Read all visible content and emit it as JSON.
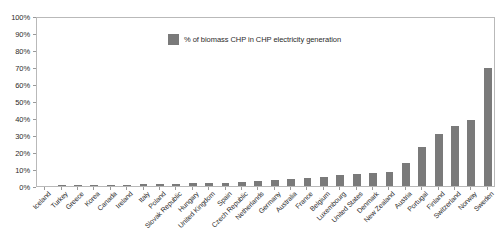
{
  "chart_data": {
    "type": "bar",
    "title": "",
    "xlabel": "",
    "ylabel": "",
    "ylim": [
      0,
      100
    ],
    "ytick_labels": [
      "100%",
      "90%",
      "80%",
      "70%",
      "60%",
      "50%",
      "40%",
      "30%",
      "20%",
      "10%",
      "0%"
    ],
    "ytick_values": [
      100,
      90,
      80,
      70,
      60,
      50,
      40,
      30,
      20,
      10,
      0
    ],
    "grid": false,
    "legend_position": "inside-top-center",
    "legend": [
      "% of biomass CHP in CHP electricity generation"
    ],
    "series_color": "#7a7a7a",
    "categories": [
      "Iceland",
      "Turkey",
      "Greece",
      "Korea",
      "Canada",
      "Ireland",
      "Italy",
      "Poland",
      "Slovak Republic",
      "Hungary",
      "United Kingdom",
      "Spain",
      "Czech Republic",
      "Netherlands",
      "Germany",
      "Australia",
      "France",
      "Belgium",
      "Luxembourg",
      "United States",
      "Denmark",
      "New Zealand",
      "Austria",
      "Portugal",
      "Finland",
      "Switzerland",
      "Norway",
      "Sweden"
    ],
    "values": [
      0.0,
      0.2,
      0.3,
      0.4,
      0.6,
      0.8,
      1.0,
      1.2,
      1.4,
      1.6,
      1.8,
      2.0,
      2.3,
      2.8,
      3.6,
      4.4,
      4.8,
      5.4,
      6.6,
      7.0,
      7.4,
      8.0,
      13.8,
      22.8,
      30.8,
      35.2,
      38.6,
      69.4
    ]
  },
  "legend": {
    "label": "% of biomass CHP in CHP electricity generation",
    "swatch_color": "#7a7a7a"
  }
}
